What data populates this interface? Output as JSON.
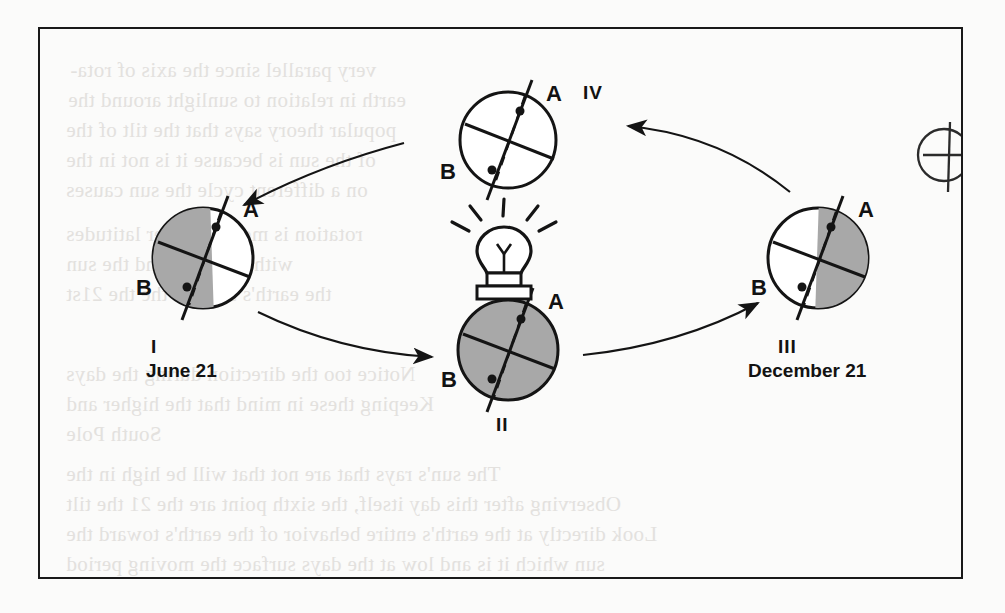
{
  "page": {
    "type": "scanned-textbook-figure",
    "background_color": "#fbfbfa",
    "frame_color": "#191919"
  },
  "figure": {
    "light_source": {
      "name": "light-bulb",
      "label": "",
      "rays": 5
    },
    "orbit": {
      "direction": "counterclockwise",
      "arrow_count": 4,
      "arrows": [
        {
          "from": "I",
          "to": "II",
          "direction": "right"
        },
        {
          "from": "II",
          "to": "III",
          "direction": "up-right"
        },
        {
          "from": "III",
          "to": "IV",
          "direction": "left"
        },
        {
          "from": "IV",
          "to": "I",
          "direction": "down-left"
        }
      ]
    },
    "earth_positions": [
      {
        "id": "I",
        "roman": "I",
        "date": "June 21",
        "shading": "left-half",
        "point_a_label": "A",
        "point_b_label": "B",
        "a_side": "upper-right",
        "b_side": "lower-left"
      },
      {
        "id": "II",
        "roman": "II",
        "date": "",
        "shading": "full",
        "point_a_label": "A",
        "point_b_label": "B",
        "a_side": "upper-right",
        "b_side": "lower-left"
      },
      {
        "id": "III",
        "roman": "III",
        "date": "December 21",
        "shading": "right-half",
        "point_a_label": "A",
        "point_b_label": "B",
        "a_side": "upper-right",
        "b_side": "lower-left"
      },
      {
        "id": "IV",
        "roman": "IV",
        "date": "",
        "shading": "none",
        "point_a_label": "A",
        "point_b_label": "B",
        "a_side": "upper-right",
        "b_side": "lower-left"
      },
      {
        "id": "V",
        "roman": "",
        "date": "",
        "shading": "none",
        "point_a_label": "",
        "point_b_label": "",
        "note": "partially cropped at right frame edge"
      }
    ],
    "colors": {
      "shade_gray": "#a8a8a8",
      "ink": "#141414",
      "bleed_text": "#e2e0dd"
    }
  },
  "bleed_text": {
    "lines": [
      "very parallel since the axis of rota-",
      "earth in relation to sunlight around the",
      "popular theory says that the tilt of the",
      "of the sun is because it is not in the",
      "on a different cycle the sun causes",
      "rotation is more at lower latitudes",
      "with the earth and the sun",
      "the earth's surface the the 21st",
      "Notice too the direction during the days",
      "Keeping these in mind that the higher and",
      "South Pole",
      "The sun's rays that are not that will be high in the",
      "Observing after this day itself, the sixth point are the 21 the tilt",
      "Look directly at the earth's entire behavior of the earth's toward the",
      "sun which it is and low at the days surface the moving period"
    ]
  }
}
